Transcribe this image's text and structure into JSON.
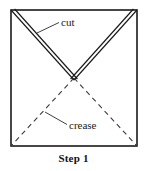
{
  "figure": {
    "caption": "Step 1",
    "labels": {
      "cut": "cut",
      "crease": "crease"
    },
    "colors": {
      "outline": "#1a1a1a",
      "cut_line": "#1a1a1a",
      "crease_line": "#3a3a3a",
      "leader_line": "#2a2a2a",
      "background": "#ffffff",
      "text": "#111111"
    },
    "geometry": {
      "square": {
        "left": 11,
        "top": 10,
        "right": 137,
        "bottom": 146
      },
      "cut_vertex": {
        "x": 74,
        "y": 80
      },
      "cut_from_left_corner": {
        "x": 11,
        "y": 10
      },
      "cut_from_right_corner": {
        "x": 137,
        "y": 10
      },
      "crease_to_bottom_left": {
        "x": 11,
        "y": 146
      },
      "crease_to_bottom_right": {
        "x": 137,
        "y": 146
      }
    }
  }
}
